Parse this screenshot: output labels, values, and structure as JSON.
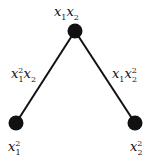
{
  "diagram": {
    "nodes": [
      {
        "id": "top",
        "x": 75,
        "y": 31,
        "r": 7,
        "label_base": [
          {
            "v": "x",
            "sub": "1",
            "sup": ""
          },
          {
            "v": "x",
            "sub": "2",
            "sup": ""
          }
        ],
        "label_text": "x1x2"
      },
      {
        "id": "left",
        "x": 16,
        "y": 123,
        "r": 7,
        "label_base": [
          {
            "v": "x",
            "sub": "1",
            "sup": "2"
          }
        ],
        "label_text": "x1^2"
      },
      {
        "id": "right",
        "x": 135,
        "y": 123,
        "r": 7,
        "label_base": [
          {
            "v": "x",
            "sub": "2",
            "sup": "2"
          }
        ],
        "label_text": "x2^2"
      }
    ],
    "edges": [
      {
        "from": "top",
        "to": "left",
        "label_text": "x1^2x2"
      },
      {
        "from": "top",
        "to": "right",
        "label_text": "x1x2^2"
      }
    ],
    "colors": {
      "node": "#111111",
      "edge": "#111111",
      "text": "#111111"
    }
  }
}
